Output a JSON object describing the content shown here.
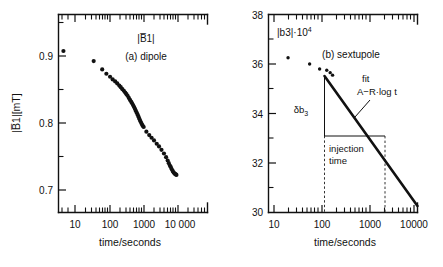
{
  "figure": {
    "caption_units": "time/seconds",
    "background": "#ffffff",
    "ink": "#111111"
  },
  "panel_a": {
    "quantity_label": "|B̅1|",
    "panel_tag": "(a)  dipole",
    "ylabel": "|B̅1|[mT]",
    "xlabel": "time/seconds",
    "ytick_labels": [
      "0.9",
      "0.8",
      "0.7"
    ],
    "xtick_labels": [
      "10",
      "100",
      "1000",
      "10 000"
    ]
  },
  "panel_b": {
    "quantity_label": "|b3|·10",
    "quantity_exponent": "4",
    "panel_tag": "(b)  sextupole",
    "xlabel": "time/seconds",
    "ytick_labels": [
      "38",
      "36",
      "34",
      "32",
      "30"
    ],
    "xtick_labels": [
      "10",
      "100",
      "1000",
      "10000"
    ],
    "fit_label": "fit",
    "fit_formula": "A−R·log t",
    "delta_label": "δb",
    "delta_subscript": "3",
    "injection_label_line1": "injection",
    "injection_label_line2": "time"
  },
  "chart_data": [
    {
      "type": "scatter",
      "id": "panel-a",
      "title": "(a)  dipole",
      "xlabel": "time/seconds",
      "ylabel": "|B̅1|[mT]",
      "xscale": "log",
      "xlim": [
        3.0,
        30000
      ],
      "ylim": [
        0.672,
        0.936
      ],
      "yticks": [
        0.9,
        0.8,
        0.7
      ],
      "xticks": [
        10,
        100,
        1000,
        10000
      ],
      "grid": false,
      "legend": false,
      "series": [
        {
          "name": "|B1| decay",
          "marker": "filled-circle",
          "x": [
            4.6,
            35,
            62,
            82,
            105,
            125,
            148,
            170,
            195,
            215,
            240,
            265,
            290,
            315,
            340,
            370,
            400,
            430,
            460,
            495,
            530,
            565,
            600,
            640,
            680,
            720,
            760,
            805,
            850,
            900,
            950,
            1000,
            1200,
            1450,
            1700,
            2000,
            2400,
            2800,
            3300,
            3900,
            4500,
            5000,
            5400,
            5800,
            6200,
            6600,
            7000,
            7400,
            7800,
            8200,
            8600,
            9000
          ],
          "y": [
            0.9075,
            0.8925,
            0.88,
            0.8735,
            0.869,
            0.865,
            0.862,
            0.859,
            0.856,
            0.8535,
            0.8505,
            0.848,
            0.8455,
            0.843,
            0.8405,
            0.8375,
            0.8345,
            0.832,
            0.8295,
            0.8265,
            0.8235,
            0.8205,
            0.8175,
            0.8145,
            0.8115,
            0.8085,
            0.8055,
            0.8025,
            0.8,
            0.7975,
            0.7955,
            0.794,
            0.787,
            0.782,
            0.778,
            0.774,
            0.769,
            0.765,
            0.76,
            0.7545,
            0.749,
            0.744,
            0.74,
            0.7365,
            0.734,
            0.731,
            0.7285,
            0.7265,
            0.725,
            0.724,
            0.7232,
            0.7225
          ]
        }
      ]
    },
    {
      "type": "scatter",
      "id": "panel-b",
      "title": "(b)  sextupole",
      "xlabel": "time/seconds",
      "ylabel": "|b3|·10^4",
      "xscale": "log",
      "xlim": [
        8.0,
        14000
      ],
      "ylim": [
        30,
        38
      ],
      "yticks": [
        38,
        36,
        34,
        32,
        30
      ],
      "xticks": [
        10,
        100,
        1000,
        10000
      ],
      "grid": false,
      "legend": false,
      "series": [
        {
          "name": "|b3| data",
          "marker": "filled-circle",
          "x": [
            20,
            58,
            95,
            135,
            160,
            180
          ],
          "y": [
            36.25,
            36.0,
            35.8,
            35.75,
            35.65,
            35.55
          ]
        },
        {
          "name": "fit A-R log t",
          "marker": "line",
          "x": [
            180,
            12000
          ],
          "y": [
            35.5,
            30.25
          ]
        }
      ],
      "annotations": [
        {
          "text": "fit",
          "x": 700,
          "y": 35.1
        },
        {
          "text": "A−R·log t",
          "x": 780,
          "y": 34.45
        },
        {
          "text": "δb3",
          "x": 260,
          "y": 34.2
        },
        {
          "text": "injection time",
          "x": 450,
          "y": 32.3
        }
      ],
      "markers": {
        "injection_start_x": 190,
        "injection_end_x": 1800,
        "delta_top_y": 35.5,
        "delta_bottom_y": 33.0
      }
    }
  ]
}
